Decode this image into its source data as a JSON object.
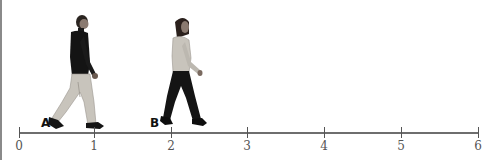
{
  "diagram": {
    "type": "number-line with walking figures",
    "axis": {
      "min": 0,
      "max": 6,
      "ticks": [
        {
          "value": 0,
          "label": "0",
          "x": 19
        },
        {
          "value": 1,
          "label": "1",
          "x": 94
        },
        {
          "value": 2,
          "label": "2",
          "x": 171
        },
        {
          "value": 3,
          "label": "3",
          "x": 247
        },
        {
          "value": 4,
          "label": "4",
          "x": 324
        },
        {
          "value": 5,
          "label": "5",
          "x": 401
        },
        {
          "value": 6,
          "label": "6",
          "x": 478
        }
      ]
    },
    "figures": [
      {
        "label": "A",
        "description": "man walking right, dark sweater, light pants",
        "position_approx": 0.8
      },
      {
        "label": "B",
        "description": "woman walking right, light sweater, dark pants",
        "position_approx": 1.9
      }
    ],
    "colors": {
      "axis": "#6e6e6e",
      "dark_clothing": "#141414",
      "light_clothing": "#c8c4bc",
      "skin": "#9a8a80"
    }
  }
}
